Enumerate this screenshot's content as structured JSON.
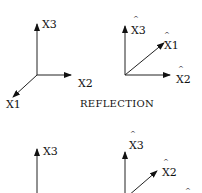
{
  "diagram": {
    "caption": "REFLECTION",
    "top_left": {
      "axes": [
        {
          "label": "X3",
          "hat": ""
        },
        {
          "label": "X2",
          "hat": ""
        },
        {
          "label": "X1",
          "hat": ""
        }
      ]
    },
    "top_right": {
      "axes": [
        {
          "label": "X3",
          "hat": "^"
        },
        {
          "label": "X1",
          "hat": "^"
        },
        {
          "label": "X2",
          "hat": "^"
        }
      ]
    },
    "bottom_left": {
      "axes": [
        {
          "label": "X3",
          "hat": ""
        }
      ]
    },
    "bottom_right": {
      "axes": [
        {
          "label": "X3",
          "hat": "^"
        },
        {
          "label": "X2",
          "hat": "^"
        },
        {
          "label": "",
          "hat": "^"
        }
      ]
    }
  }
}
